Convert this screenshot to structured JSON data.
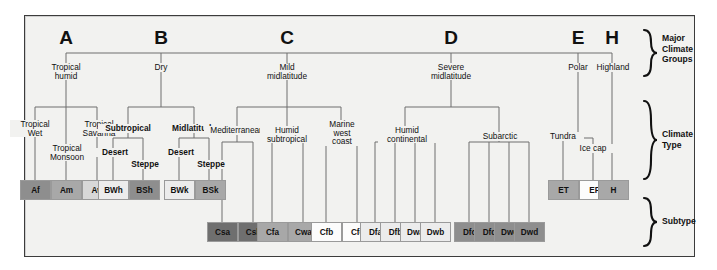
{
  "figure": {
    "background": "#f2f2f0",
    "line_color": "#6e6e6e"
  },
  "tiers": [
    {
      "key": "major",
      "label_lines": [
        "Major",
        "Climate",
        "Groups"
      ]
    },
    {
      "key": "type",
      "label_lines": [
        "Climate",
        "Type"
      ]
    },
    {
      "key": "subtype",
      "label_lines": [
        "Subtype"
      ]
    }
  ],
  "bracket_labels": {
    "major": "Major\nClimate\nGroups",
    "major_l1": "Major",
    "major_l2": "Climate",
    "major_l3": "Groups",
    "type_l1": "Climate",
    "type_l2": "Type",
    "subtype_l1": "Subtype"
  },
  "groups": [
    {
      "letter": "A",
      "name": "Tropical\nhumid",
      "name_l1": "Tropical",
      "name_l2": "humid"
    },
    {
      "letter": "B",
      "name": "Dry",
      "name_l1": "Dry",
      "name_l2": ""
    },
    {
      "letter": "C",
      "name": "Mild\nmidlatitude",
      "name_l1": "Mild",
      "name_l2": "midlatitude"
    },
    {
      "letter": "D",
      "name": "Severe\nmidlatitude",
      "name_l1": "Severe",
      "name_l2": "midlatitude"
    },
    {
      "letter": "E",
      "name": "Polar",
      "name_l1": "Polar",
      "name_l2": ""
    },
    {
      "letter": "H",
      "name": "Highland",
      "name_l1": "Highland",
      "name_l2": ""
    }
  ],
  "climate_types": {
    "a1_l1": "Tropical",
    "a1_l2": "Wet",
    "a2_l1": "Tropical",
    "a2_l2": "Monsoon",
    "a3_l1": "Tropical",
    "a3_l2": "Savanna",
    "b1": "Subtropical",
    "b2": "Midlatitude",
    "b1a": "Desert",
    "b1b": "Steppe",
    "b2a": "Desert",
    "b2b": "Steppe",
    "c1": "Mediterranean",
    "c2_l1": "Humid",
    "c2_l2": "subtropical",
    "c3_l1": "Marine",
    "c3_l2": "west",
    "c3_l3": "coast",
    "d1_l1": "Humid",
    "d1_l2": "continental",
    "d2": "Subarctic",
    "e1": "Tundra",
    "e2": "Ice cap",
    "h1": "Highland"
  },
  "codes": [
    {
      "code": "Af",
      "shade": "sh-dark",
      "group": "A"
    },
    {
      "code": "Am",
      "shade": "sh-med",
      "group": "A"
    },
    {
      "code": "Aw",
      "shade": "sh-light",
      "group": "A"
    },
    {
      "code": "BWh",
      "shade": "sh-pale",
      "group": "B"
    },
    {
      "code": "BSh",
      "shade": "sh-dark",
      "group": "B"
    },
    {
      "code": "BWk",
      "shade": "sh-pale",
      "group": "B"
    },
    {
      "code": "BSk",
      "shade": "sh-med",
      "group": "B"
    },
    {
      "code": "Csa",
      "shade": "sh-dark2",
      "group": "C"
    },
    {
      "code": "Csb",
      "shade": "sh-dark2",
      "group": "C"
    },
    {
      "code": "Cfa",
      "shade": "sh-med",
      "group": "C"
    },
    {
      "code": "Cwa",
      "shade": "sh-med",
      "group": "C"
    },
    {
      "code": "Cfb",
      "shade": "sh-white",
      "group": "C"
    },
    {
      "code": "Cfc",
      "shade": "sh-white",
      "group": "C"
    },
    {
      "code": "Dfa",
      "shade": "sh-pale",
      "group": "D"
    },
    {
      "code": "Dfb",
      "shade": "sh-pale",
      "group": "D"
    },
    {
      "code": "Dwa",
      "shade": "sh-pale",
      "group": "D"
    },
    {
      "code": "Dwb",
      "shade": "sh-pale",
      "group": "D"
    },
    {
      "code": "Dfc",
      "shade": "sh-dark",
      "group": "D"
    },
    {
      "code": "Dfd",
      "shade": "sh-dark",
      "group": "D"
    },
    {
      "code": "Dwc",
      "shade": "sh-dark",
      "group": "D"
    },
    {
      "code": "Dwd",
      "shade": "sh-dark",
      "group": "D"
    },
    {
      "code": "ET",
      "shade": "sh-med",
      "group": "E"
    },
    {
      "code": "EF",
      "shade": "sh-white",
      "group": "E"
    },
    {
      "code": "H",
      "shade": "sh-med",
      "group": "H"
    }
  ]
}
